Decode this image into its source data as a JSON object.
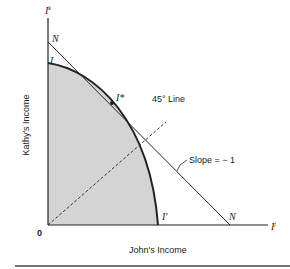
{
  "diagram": {
    "axes": {
      "y_axis_symbol": "I",
      "y_axis_sup": "k",
      "x_axis_symbol": "I",
      "x_axis_sup": "j",
      "origin": "0",
      "xlabel": "John's Income",
      "ylabel": "Kathy's Income"
    },
    "points": {
      "N_top": "N",
      "I_top": "I",
      "I_star": "I*",
      "I_prime": "I'",
      "N_right": "N"
    },
    "annotations": {
      "line_45": "45° Line",
      "slope": "Slope = − 1"
    },
    "colors": {
      "fill": "#d4d4d4",
      "line": "#222222"
    }
  }
}
